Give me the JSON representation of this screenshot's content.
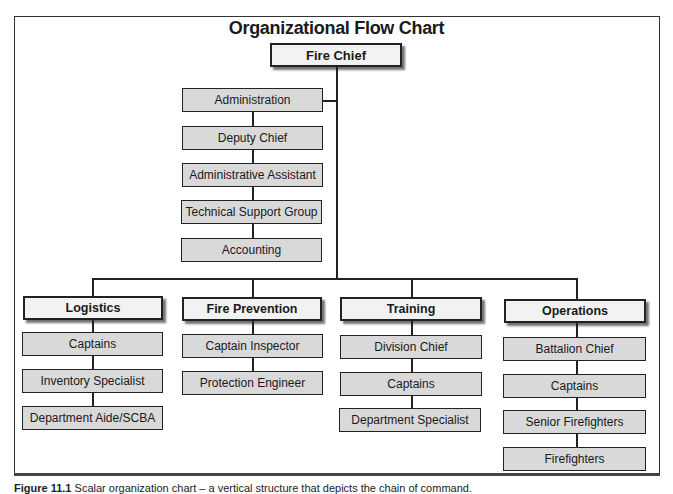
{
  "title": "Organizational Flow Chart",
  "top": {
    "label": "Fire Chief"
  },
  "staff": [
    {
      "label": "Administration"
    },
    {
      "label": "Deputy Chief"
    },
    {
      "label": "Administrative Assistant"
    },
    {
      "label": "Technical Support Group"
    },
    {
      "label": "Accounting"
    }
  ],
  "divisions": [
    {
      "label": "Logistics",
      "children": [
        "Captains",
        "Inventory Specialist",
        "Department Aide/SCBA"
      ]
    },
    {
      "label": "Fire Prevention",
      "children": [
        "Captain Inspector",
        "Protection Engineer"
      ]
    },
    {
      "label": "Training",
      "children": [
        "Division Chief",
        "Captains",
        "Department Specialist"
      ]
    },
    {
      "label": "Operations",
      "children": [
        "Battalion Chief",
        "Captains",
        "Senior Firefighters",
        "Firefighters"
      ]
    }
  ],
  "caption": {
    "label": "Figure 11.1",
    "text": "Scalar organization chart – a vertical structure that depicts the chain of command."
  },
  "colors": {
    "sub_box": "#d9d9d9",
    "head_box": "#f2f2f2",
    "line": "#222222"
  }
}
